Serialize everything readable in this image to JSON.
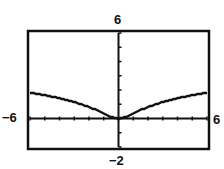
{
  "chart_data": {
    "type": "line",
    "title": "",
    "xlabel": "",
    "ylabel": "",
    "xlim": [
      -6,
      6
    ],
    "ylim": [
      -2,
      6
    ],
    "grid": false,
    "x_ticks_step": 1,
    "y_ticks_step": 1,
    "window_labels": {
      "xmin": "−6",
      "xmax": "6",
      "ymin": "−2",
      "ymax": "6"
    },
    "series": [
      {
        "name": "y = ln(1 + x^2)/2 (approx.)",
        "x": [
          -6,
          -5,
          -4,
          -3,
          -2,
          -1,
          0,
          1,
          2,
          3,
          4,
          5,
          6
        ],
        "y": [
          1.8,
          1.63,
          1.42,
          1.15,
          0.8,
          0.35,
          0,
          0.35,
          0.8,
          1.15,
          1.42,
          1.63,
          1.8
        ]
      }
    ]
  },
  "labels": {
    "ymax": "6",
    "xmin": "−6",
    "xmax": "6",
    "ymin": "−2"
  }
}
